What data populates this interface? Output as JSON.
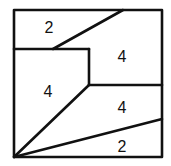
{
  "diagram": {
    "stroke_color": "#111111",
    "regions": [
      {
        "id": "top-left",
        "label": "2",
        "x": 49,
        "y": 27
      },
      {
        "id": "top-right",
        "label": "4",
        "x": 122,
        "y": 56
      },
      {
        "id": "middle-left",
        "label": "4",
        "x": 48,
        "y": 91
      },
      {
        "id": "middle-right",
        "label": "4",
        "x": 122,
        "y": 107
      },
      {
        "id": "bottom-right",
        "label": "2",
        "x": 122,
        "y": 146
      }
    ]
  }
}
